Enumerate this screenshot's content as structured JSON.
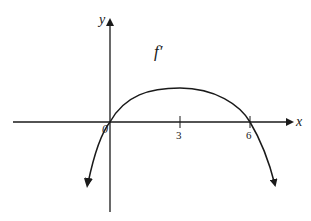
{
  "figure": {
    "function_label": "f′",
    "axes": {
      "x_label": "x",
      "y_label": "y",
      "origin_label": "0"
    },
    "ticks": [
      {
        "value": "3"
      },
      {
        "value": "6"
      }
    ],
    "colors": {
      "stroke": "#1a1a1a",
      "background": "#ffffff"
    }
  }
}
